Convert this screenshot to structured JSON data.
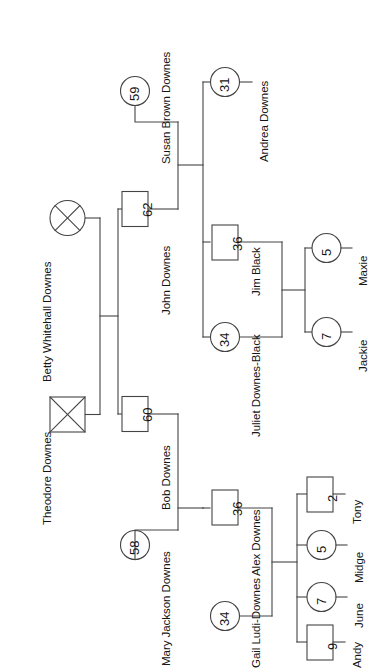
{
  "diagram": {
    "type": "genogram",
    "orientation": "rotated-90",
    "line_color": "#444444",
    "text_color": "#151515",
    "background": "#ffffff",
    "legend": {
      "square": "male",
      "circle": "female",
      "x_mark": "deceased"
    }
  },
  "people": [
    {
      "id": "theodore",
      "name": "Theodore Downes",
      "age": "",
      "shape": "square",
      "deceased": true,
      "generation": 1
    },
    {
      "id": "betty",
      "name": "Betty Whitehall Downes",
      "age": "",
      "shape": "circle",
      "deceased": true,
      "generation": 1
    },
    {
      "id": "john",
      "name": "John Downes",
      "age": "62",
      "shape": "square",
      "deceased": false,
      "generation": 2
    },
    {
      "id": "susan",
      "name": "Susan Brown Downes",
      "age": "59",
      "shape": "circle",
      "deceased": false,
      "generation": 2
    },
    {
      "id": "bob",
      "name": "Bob Downes",
      "age": "60",
      "shape": "square",
      "deceased": false,
      "generation": 2
    },
    {
      "id": "mary",
      "name": "Mary Jackson Downes",
      "age": "58",
      "shape": "circle",
      "deceased": false,
      "generation": 2
    },
    {
      "id": "andrea",
      "name": "Andrea Downes",
      "age": "31",
      "shape": "circle",
      "deceased": false,
      "generation": 3
    },
    {
      "id": "jim",
      "name": "Jim Black",
      "age": "36",
      "shape": "square",
      "deceased": false,
      "generation": 3
    },
    {
      "id": "juliet",
      "name": "Juliet Downes-Black",
      "age": "34",
      "shape": "circle",
      "deceased": false,
      "generation": 3
    },
    {
      "id": "alex",
      "name": "Alex Downes",
      "age": "36",
      "shape": "square",
      "deceased": false,
      "generation": 3
    },
    {
      "id": "gail",
      "name": "Gail Ludi-Downes",
      "age": "34",
      "shape": "circle",
      "deceased": false,
      "generation": 3
    },
    {
      "id": "maxie",
      "name": "Maxie",
      "age": "5",
      "shape": "circle",
      "deceased": false,
      "generation": 4
    },
    {
      "id": "jackie",
      "name": "Jackie",
      "age": "7",
      "shape": "circle",
      "deceased": false,
      "generation": 4
    },
    {
      "id": "tony",
      "name": "Tony",
      "age": "2",
      "shape": "square",
      "deceased": false,
      "generation": 4
    },
    {
      "id": "midge",
      "name": "Midge",
      "age": "5",
      "shape": "circle",
      "deceased": false,
      "generation": 4
    },
    {
      "id": "june",
      "name": "June",
      "age": "7",
      "shape": "circle",
      "deceased": false,
      "generation": 4
    },
    {
      "id": "andy",
      "name": "Andy",
      "age": "9",
      "shape": "square",
      "deceased": false,
      "generation": 4
    }
  ],
  "unions": [
    {
      "partners": [
        "theodore",
        "betty"
      ],
      "children": [
        "john",
        "bob"
      ]
    },
    {
      "partners": [
        "john",
        "susan"
      ],
      "children": [
        "andrea",
        "juliet"
      ]
    },
    {
      "partners": [
        "bob",
        "mary"
      ],
      "children": [
        "alex"
      ]
    },
    {
      "partners": [
        "jim",
        "juliet"
      ],
      "children": [
        "maxie",
        "jackie"
      ]
    },
    {
      "partners": [
        "alex",
        "gail"
      ],
      "children": [
        "tony",
        "midge",
        "june",
        "andy"
      ]
    }
  ]
}
